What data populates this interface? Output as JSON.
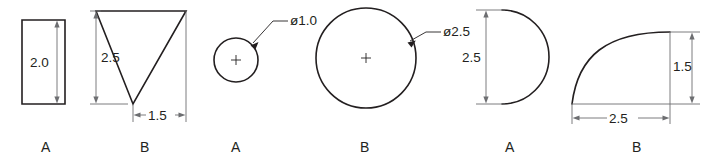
{
  "drawing": {
    "title": "Cross-section profile dimension set",
    "colors": {
      "outline": "#231f20",
      "dimension": "#6d6e71",
      "background": "#ffffff"
    },
    "figures": [
      {
        "id": "figure-1-rectangle",
        "shape": "rectangle",
        "label": "A",
        "dimensions": [
          {
            "name": "height",
            "value": "2.0",
            "orientation": "vertical"
          }
        ]
      },
      {
        "id": "figure-2-right-triangle",
        "shape": "right-triangle",
        "label": "B",
        "dimensions": [
          {
            "name": "height",
            "value": "2.5",
            "orientation": "vertical"
          },
          {
            "name": "base",
            "value": "1.5",
            "orientation": "horizontal"
          }
        ]
      },
      {
        "id": "figure-3-small-circle",
        "shape": "circle",
        "label": "A",
        "dimensions": [
          {
            "name": "diameter",
            "value": "ø1.0",
            "orientation": "leader"
          }
        ]
      },
      {
        "id": "figure-4-large-circle",
        "shape": "circle",
        "label": "B",
        "dimensions": [
          {
            "name": "diameter",
            "value": "ø2.5",
            "orientation": "leader"
          }
        ]
      },
      {
        "id": "figure-5-semicircle",
        "shape": "semicircle",
        "label": "A",
        "dimensions": [
          {
            "name": "height",
            "value": "2.5",
            "orientation": "vertical"
          }
        ]
      },
      {
        "id": "figure-6-quarter-arc",
        "shape": "quarter-arc",
        "label": "B",
        "dimensions": [
          {
            "name": "width",
            "value": "2.5",
            "orientation": "horizontal"
          },
          {
            "name": "height",
            "value": "1.5",
            "orientation": "vertical"
          }
        ]
      }
    ],
    "labels_row": [
      "A",
      "B",
      "A",
      "B",
      "A",
      "B"
    ],
    "dimension_values": {
      "rect_height": "2.0",
      "tri_height": "2.5",
      "tri_base": "1.5",
      "small_circle_dia": "ø1.0",
      "large_circle_dia": "ø2.5",
      "semicircle_height": "2.5",
      "arc_width": "2.5",
      "arc_height": "1.5"
    }
  }
}
